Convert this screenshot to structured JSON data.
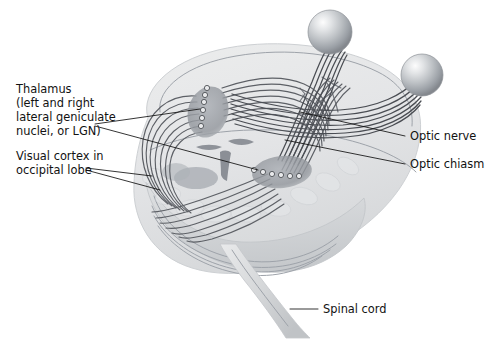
{
  "figure": {
    "background_color": "#ffffff",
    "width": 486,
    "height": 339
  },
  "labels": {
    "thalamus": {
      "lines": [
        "Thalamus",
        "(left and right",
        "lateral geniculate",
        "nuclei, or LGN)"
      ],
      "line1": "Thalamus",
      "line2": "(left and right",
      "line3": "lateral geniculate",
      "line4": "nuclei, or LGN)"
    },
    "visual_cortex": {
      "lines": [
        "Visual cortex in",
        "occipital lobe"
      ],
      "line1": "Visual cortex in",
      "line2": "occipital lobe"
    },
    "optic_nerve": {
      "text": "Optic nerve"
    },
    "optic_chiasm": {
      "text": "Optic chiasm"
    },
    "spinal_cord": {
      "text": "Spinal cord"
    }
  },
  "anatomy": {
    "structures": [
      "eyeball-left",
      "eyeball-right",
      "optic-nerve-left",
      "optic-nerve-right",
      "optic-chiasm",
      "optic-tract-left",
      "optic-tract-right",
      "lgn-left",
      "lgn-right",
      "optic-radiation",
      "cerebrum",
      "cerebellum",
      "brainstem",
      "spinal-cord"
    ]
  },
  "colors": {
    "brain_fill": "#e8e9ea",
    "brain_stroke": "#c9ccd0",
    "fiber": "#5d6066",
    "fiber_dark": "#4a4d53",
    "eyeball_light": "#f2f3f4",
    "eyeball_mid": "#b9bcc0",
    "eyeball_dark": "#8b8f95",
    "lgn_fill": "#9a9ea4",
    "label_text": "#121212",
    "leader_line": "#101010",
    "cerebellum": "#d3d5d8"
  }
}
